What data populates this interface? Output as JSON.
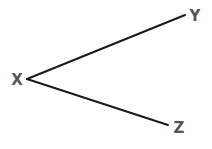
{
  "diagram": {
    "type": "tree",
    "colors": {
      "edge": "#1a1a1a",
      "label": "#555555",
      "background": "#ffffff"
    },
    "nodes": [
      {
        "id": "X",
        "label": "X",
        "x": 17,
        "y": 85,
        "anchor": [
          27,
          79
        ]
      },
      {
        "id": "Y",
        "label": "Y",
        "x": 195,
        "y": 21,
        "anchor": [
          185,
          15
        ]
      },
      {
        "id": "Z",
        "label": "Z",
        "x": 179,
        "y": 133,
        "anchor": [
          168,
          125
        ]
      }
    ],
    "edges": [
      {
        "from": "X",
        "to": "Y"
      },
      {
        "from": "X",
        "to": "Z"
      }
    ]
  }
}
